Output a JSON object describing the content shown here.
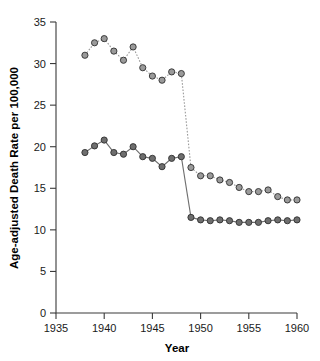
{
  "chart_data": {
    "type": "line",
    "title": "",
    "xlabel": "Year",
    "ylabel": "Age-adjusted Death Rate per 100,000",
    "xlim": [
      1935,
      1960
    ],
    "ylim": [
      0,
      35
    ],
    "xticks": [
      1935,
      1940,
      1945,
      1950,
      1955,
      1960
    ],
    "yticks": [
      0,
      5,
      10,
      15,
      20,
      25,
      30,
      35
    ],
    "grid": false,
    "legend": "none",
    "x": [
      1938,
      1939,
      1940,
      1941,
      1942,
      1943,
      1944,
      1945,
      1946,
      1947,
      1948,
      1949,
      1950,
      1951,
      1952,
      1953,
      1954,
      1955,
      1956,
      1957,
      1958,
      1959,
      1960
    ],
    "series": [
      {
        "name": "upper-series",
        "color": "#9a9a9a",
        "marker": "circle",
        "line_style_before_break": "dotted",
        "line_style_after_break": "dotted",
        "values": [
          31.0,
          32.5,
          33.0,
          31.5,
          30.4,
          32.0,
          29.5,
          28.5,
          28.0,
          29.0,
          28.8,
          17.5,
          16.5,
          16.5,
          16.0,
          15.7,
          15.1,
          14.6,
          14.6,
          14.8,
          14.0,
          13.6,
          13.6
        ]
      },
      {
        "name": "lower-series",
        "color": "#6e6e6e",
        "marker": "circle",
        "line_style_before_break": "solid",
        "line_style_after_break": "solid",
        "values": [
          19.3,
          20.1,
          20.8,
          19.3,
          19.1,
          20.0,
          18.8,
          18.6,
          17.6,
          18.6,
          18.8,
          11.5,
          11.2,
          11.1,
          11.2,
          11.1,
          10.9,
          10.9,
          10.9,
          11.1,
          11.2,
          11.1,
          11.2
        ]
      }
    ],
    "break_year": 1948,
    "annotations": []
  },
  "axis": {
    "x_tick_labels": [
      "1935",
      "1940",
      "1945",
      "1950",
      "1955",
      "1960"
    ],
    "y_tick_labels": [
      "0",
      "5",
      "10",
      "15",
      "20",
      "25",
      "30",
      "35"
    ],
    "x_title": "Year",
    "y_title": "Age-adjusted Death Rate per 100,000"
  }
}
